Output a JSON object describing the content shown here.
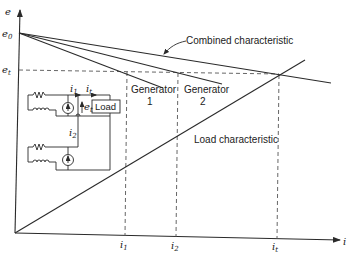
{
  "axes": {
    "y_label": "e",
    "x_label": "i",
    "y_ticks": [
      {
        "main": "e",
        "sub": "0"
      },
      {
        "main": "e",
        "sub": "t"
      }
    ],
    "x_ticks": [
      {
        "main": "i",
        "sub": "1"
      },
      {
        "main": "i",
        "sub": "2"
      },
      {
        "main": "i",
        "sub": "t"
      }
    ]
  },
  "curves": {
    "combined": "Combined characteristic",
    "generator1_line1": "Generator",
    "generator1_line2": "1",
    "generator2_line1": "Generator",
    "generator2_line2": "2",
    "load": "Load characteristic"
  },
  "circuit": {
    "load_label": "Load",
    "current_i1": {
      "main": "i",
      "sub": "1"
    },
    "current_it": {
      "main": "i",
      "sub": "t"
    },
    "current_i2": {
      "main": "i",
      "sub": "2"
    },
    "voltage_et": {
      "main": "e",
      "sub": "t"
    }
  }
}
